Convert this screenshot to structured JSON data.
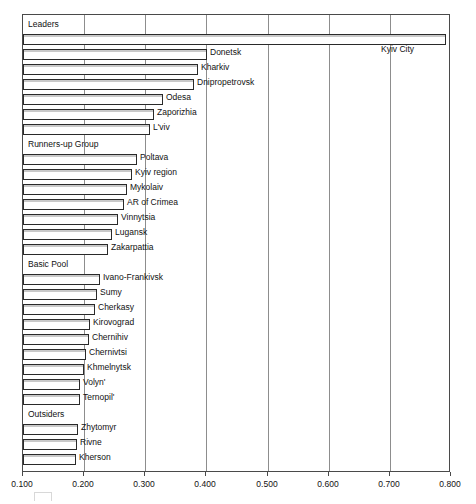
{
  "chart_data": {
    "type": "bar",
    "orientation": "horizontal",
    "title": "",
    "subtitle": "",
    "xlabel": "",
    "ylabel": "",
    "xlim": [
      0.1,
      0.8
    ],
    "grid": true,
    "grid_axis": "x",
    "legend": null,
    "x_ticks": [
      "0.100",
      "0.200",
      "0.300",
      "0.400",
      "0.500",
      "0.600",
      "0.700",
      "0.800"
    ],
    "x_tick_values": [
      0.1,
      0.2,
      0.3,
      0.4,
      0.5,
      0.6,
      0.7,
      0.8
    ],
    "groups": [
      {
        "name": "Leaders",
        "items": [
          {
            "label": "Kyiv City",
            "value": 0.792,
            "label_side": "inside-right"
          },
          {
            "label": "Donetsk",
            "value": 0.401,
            "label_side": "right"
          },
          {
            "label": "Kharkiv",
            "value": 0.386,
            "label_side": "right"
          },
          {
            "label": "Dnipropetrovsk",
            "value": 0.38,
            "label_side": "right"
          },
          {
            "label": "Odesa",
            "value": 0.329,
            "label_side": "right"
          },
          {
            "label": "Zaporizhia",
            "value": 0.314,
            "label_side": "right"
          },
          {
            "label": "L'viv",
            "value": 0.308,
            "label_side": "right"
          }
        ]
      },
      {
        "name": "Runners-up Group",
        "items": [
          {
            "label": "Poltava",
            "value": 0.287,
            "label_side": "right"
          },
          {
            "label": "Kyiv region",
            "value": 0.278,
            "label_side": "right"
          },
          {
            "label": "Mykolaiv",
            "value": 0.27,
            "label_side": "right"
          },
          {
            "label": "AR of Crimea",
            "value": 0.265,
            "label_side": "right"
          },
          {
            "label": "Vinnytsia",
            "value": 0.255,
            "label_side": "right"
          },
          {
            "label": "Lugansk",
            "value": 0.246,
            "label_side": "right"
          },
          {
            "label": "Zakarpattia",
            "value": 0.239,
            "label_side": "right"
          }
        ]
      },
      {
        "name": "Basic Pool",
        "items": [
          {
            "label": "Ivano-Frankivsk",
            "value": 0.226,
            "label_side": "right"
          },
          {
            "label": "Sumy",
            "value": 0.221,
            "label_side": "right"
          },
          {
            "label": "Cherkasy",
            "value": 0.218,
            "label_side": "right"
          },
          {
            "label": "Kirovograd",
            "value": 0.21,
            "label_side": "right"
          },
          {
            "label": "Chernihiv",
            "value": 0.208,
            "label_side": "right"
          },
          {
            "label": "Chernivtsi",
            "value": 0.203,
            "label_side": "right"
          },
          {
            "label": "Khmelnytsk",
            "value": 0.2,
            "label_side": "right"
          },
          {
            "label": "Volyn'",
            "value": 0.194,
            "label_side": "right"
          },
          {
            "label": "Ternopil'",
            "value": 0.193,
            "label_side": "right"
          }
        ]
      },
      {
        "name": "Outsiders",
        "items": [
          {
            "label": "Zhytomyr",
            "value": 0.19,
            "label_side": "right"
          },
          {
            "label": "Rivne",
            "value": 0.188,
            "label_side": "right"
          },
          {
            "label": "Kherson",
            "value": 0.187,
            "label_side": "right"
          }
        ]
      }
    ],
    "colors": {
      "bar_fill": "#ffffff",
      "bar_edge": "#2a2a2a",
      "bar_shade": "#c9c9c9",
      "gridline": "#8d8d8d",
      "frame": "#4a4a4a",
      "text": "#111111",
      "background": "#ffffff"
    }
  }
}
